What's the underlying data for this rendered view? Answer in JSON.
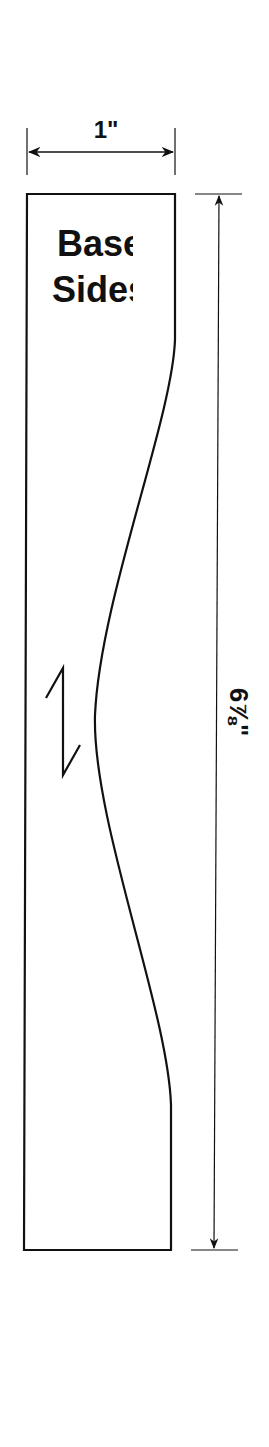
{
  "part": {
    "title_line1": "Base",
    "title_line2": "Sides",
    "width_label": "1\"",
    "height_label": "6⅞\"",
    "grain_symbol": "break-zigzag"
  },
  "colors": {
    "stroke": "#111111",
    "background": "#ffffff"
  }
}
